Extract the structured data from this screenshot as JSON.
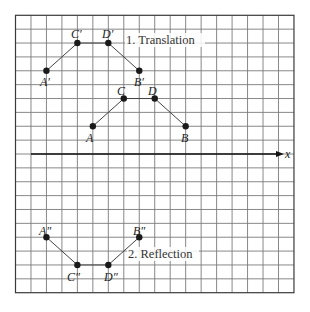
{
  "figure": {
    "grid": {
      "columns": 18,
      "rows": 20,
      "left": 15.5,
      "top": 15.3,
      "col_spacing": 15.47,
      "row_spacing": 13.87,
      "line_color": "#7a7a7a"
    },
    "axis": {
      "label": "x",
      "row": 10,
      "start_col": 1,
      "end_x": 284
    },
    "captions": {
      "translation": "1. Translation",
      "reflection": "2. Reflection"
    },
    "figures": {
      "original": {
        "points": [
          {
            "name": "A",
            "col": 5,
            "row": 8
          },
          {
            "name": "C",
            "col": 7,
            "row": 6
          },
          {
            "name": "D",
            "col": 9,
            "row": 6
          },
          {
            "name": "B",
            "col": 11,
            "row": 8
          }
        ]
      },
      "translation": {
        "points": [
          {
            "name": "A′",
            "col": 2,
            "row": 4
          },
          {
            "name": "C′",
            "col": 4,
            "row": 2
          },
          {
            "name": "D′",
            "col": 6,
            "row": 2
          },
          {
            "name": "B′",
            "col": 8,
            "row": 4
          }
        ]
      },
      "reflection": {
        "points": [
          {
            "name": "A″",
            "col": 2,
            "row": 16
          },
          {
            "name": "C″",
            "col": 4,
            "row": 18
          },
          {
            "name": "D″",
            "col": 6,
            "row": 18
          },
          {
            "name": "B″",
            "col": 8,
            "row": 16
          }
        ]
      }
    },
    "labels": {
      "A": "A",
      "B": "B",
      "C": "C",
      "D": "D",
      "A1": "A′",
      "B1": "B′",
      "C1": "C′",
      "D1": "D′",
      "A2": "A″",
      "B2": "B″",
      "C2": "C″",
      "D2": "D″"
    }
  }
}
